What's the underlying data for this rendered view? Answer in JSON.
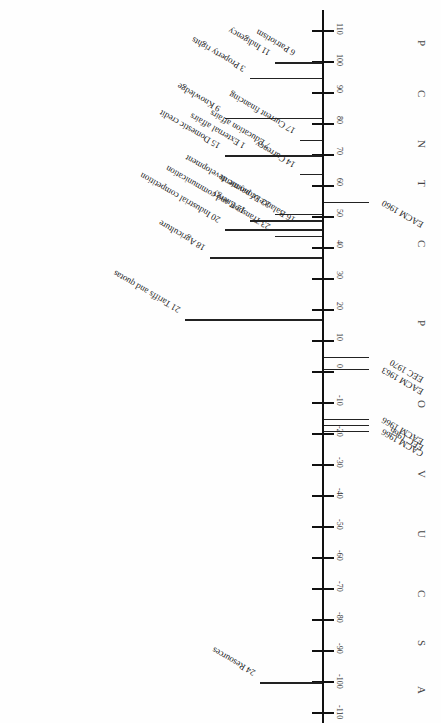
{
  "diagram": {
    "axis": {
      "ticks": [
        "110",
        "100",
        "90",
        "80",
        "70",
        "60",
        "50",
        "40",
        "30",
        "20",
        "10",
        "0",
        "-10",
        "-20",
        "-30",
        "-40",
        "-50",
        "-60",
        "-70",
        "-80",
        "-90",
        "-100",
        "-110"
      ]
    },
    "left_labels": [
      {
        "text": "6 Patriotism",
        "value": 100
      },
      {
        "text": "11 Indigency",
        "value": 100
      },
      {
        "text": "3 Property rights",
        "value": 95
      },
      {
        "text": "9 Knowledge",
        "value": 82
      },
      {
        "text": "17 Current financing",
        "value": 75
      },
      {
        "text": "7 Education affairs",
        "value": 70
      },
      {
        "text": "1 External affairs",
        "value": 70
      },
      {
        "text": "15 Domestic credit",
        "value": 70
      },
      {
        "text": "14 Currency",
        "value": 64
      },
      {
        "text": "22 Economic development",
        "value": 51
      },
      {
        "text": "12 Energy",
        "value": 49
      },
      {
        "text": "20 Industrial competition",
        "value": 46
      },
      {
        "text": "16 Balance of payments",
        "value": 46
      },
      {
        "text": "23 Transport and communication",
        "value": 44
      },
      {
        "text": "18 Agriculture",
        "value": 37
      },
      {
        "text": "21 Tariffs and quotas",
        "value": 17
      },
      {
        "text": "24 Resources",
        "value": -100
      }
    ],
    "right_labels": [
      {
        "text": "EACM 1960",
        "value": 55
      },
      {
        "text": "EEC 1970",
        "value": 5
      },
      {
        "text": "EACM 1963",
        "value": 1
      },
      {
        "text": "EACM 1966",
        "value": -15
      },
      {
        "text": "EEC 1966",
        "value": -17
      },
      {
        "text": "CACM 1966",
        "value": -19
      }
    ],
    "running_title_letters": [
      "A",
      "S",
      "C",
      "U",
      "V",
      "O",
      "P",
      "C",
      "T",
      "N",
      "C",
      "P"
    ]
  }
}
